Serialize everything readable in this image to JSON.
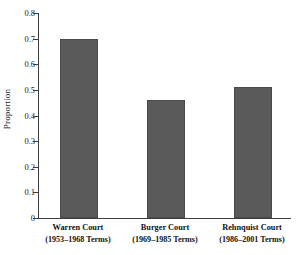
{
  "chart_data": {
    "type": "bar",
    "title": "",
    "xlabel": "",
    "ylabel": "Proportion",
    "ylim": [
      0,
      0.8
    ],
    "grid": false,
    "legend": null,
    "categories": [
      "Warren Court",
      "Burger Court",
      "Rehnquist Court"
    ],
    "category_sublabels": [
      "(1953–1968 Terms)",
      "(1969–1985 Terms)",
      "(1986–2001 Terms)"
    ],
    "values": [
      0.7,
      0.46,
      0.51
    ],
    "ytick_labels": [
      "0.8",
      "0.7",
      "0.6",
      "0.5",
      "0.4",
      "0.3",
      "0.2",
      "0.1",
      "0"
    ],
    "ytick_values": [
      0.8,
      0.7,
      0.6,
      0.5,
      0.4,
      0.3,
      0.2,
      0.1,
      0
    ],
    "bar_color": "#5a5a5a",
    "axis_color": "#3d3d3d",
    "background_color": "#ffffff"
  }
}
